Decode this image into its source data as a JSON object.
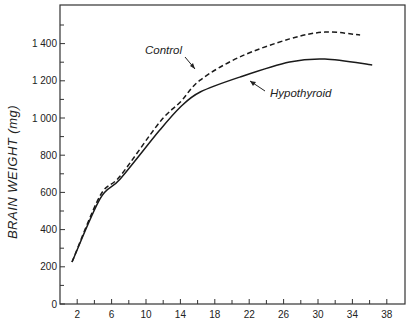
{
  "chart_data": {
    "type": "line",
    "title": "",
    "xlabel": "",
    "ylabel": "BRAIN WEIGHT (mg)",
    "xlim": [
      0,
      40
    ],
    "ylim": [
      0,
      1600
    ],
    "xticks": [
      2,
      6,
      10,
      14,
      18,
      22,
      26,
      30,
      34,
      38
    ],
    "xminor_ticks": [
      4,
      8,
      12,
      16,
      20,
      24,
      28,
      32,
      36
    ],
    "yticks": [
      0,
      200,
      400,
      600,
      800,
      1000,
      1200,
      1400
    ],
    "ytick_labels": [
      "0",
      "200",
      "400",
      "600",
      "800",
      "1 000",
      "1 200",
      "1 400"
    ],
    "yminor_ticks": [
      100,
      300,
      500,
      700,
      900,
      1100,
      1300,
      1500
    ],
    "grid": false,
    "legend": "inline annotations with arrows",
    "series": [
      {
        "name": "Control",
        "style": "dashed",
        "x": [
          1.4,
          4.65,
          7.0,
          11.6,
          14.0,
          16.3,
          20.9,
          26.7,
          30.8,
          34.9
        ],
        "y": [
          226,
          581,
          688,
          978,
          1086,
          1204,
          1328,
          1425,
          1462,
          1446
        ]
      },
      {
        "name": "Hypothyroid",
        "style": "solid",
        "x": [
          1.4,
          4.65,
          7.0,
          11.6,
          14.0,
          16.3,
          20.9,
          26.7,
          30.8,
          36.3
        ],
        "y": [
          226,
          565,
          672,
          935,
          1059,
          1140,
          1220,
          1301,
          1317,
          1285
        ]
      }
    ],
    "annotations": [
      {
        "text": "Control",
        "target_series": "Control"
      },
      {
        "text": "Hypothyroid",
        "target_series": "Hypothyroid"
      }
    ]
  },
  "labels": {
    "ylabel": "BRAIN WEIGHT (mg)",
    "control": "Control",
    "hypothyroid": "Hypothyroid"
  }
}
